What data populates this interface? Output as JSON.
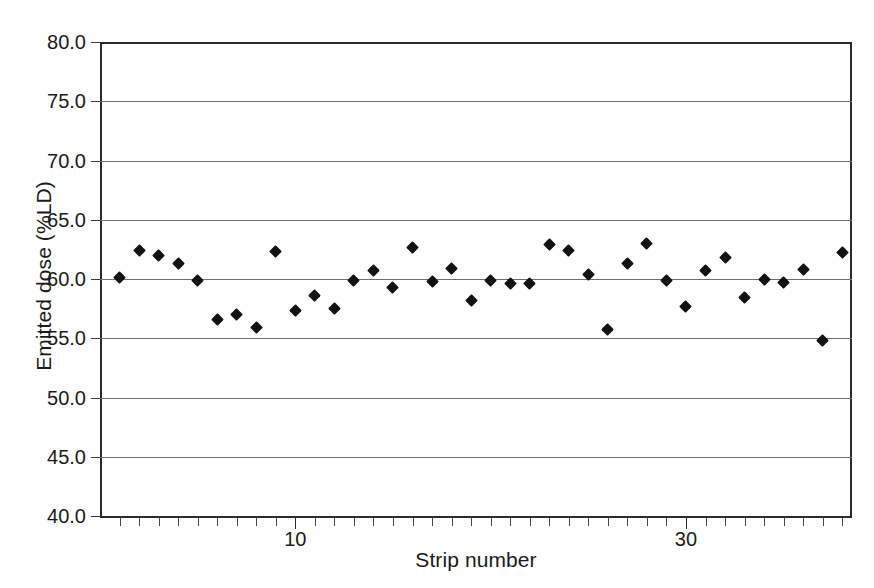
{
  "chart_data": {
    "type": "scatter",
    "title": "",
    "xlabel": "Strip number",
    "ylabel": "Emitted dose (%LD)",
    "xlim": [
      0,
      38.5
    ],
    "ylim": [
      40.0,
      80.0
    ],
    "grid": true,
    "legend": null,
    "marker": "black-diamond",
    "y_ticks": [
      40.0,
      45.0,
      50.0,
      55.0,
      60.0,
      65.0,
      70.0,
      75.0,
      80.0
    ],
    "y_tick_labels": [
      "40.0",
      "45.0",
      "50.0",
      "55.0",
      "60.0",
      "65.0",
      "70.0",
      "75.0",
      "80.0"
    ],
    "x_ticks": [
      10,
      30
    ],
    "x_tick_labels": [
      "10",
      "30"
    ],
    "x_minor_tick_step": 1,
    "series": [
      {
        "name": "Emitted dose",
        "color": "#121212",
        "x": [
          1,
          2,
          3,
          4,
          5,
          6,
          7,
          8,
          9,
          10,
          11,
          12,
          13,
          14,
          15,
          16,
          17,
          18,
          19,
          20,
          21,
          22,
          23,
          24,
          25,
          26,
          27,
          28,
          29,
          30,
          31,
          32,
          33,
          34,
          35,
          36,
          37,
          38
        ],
        "y": [
          60.1,
          62.4,
          62.0,
          61.3,
          59.9,
          56.6,
          57.0,
          55.9,
          62.3,
          57.3,
          58.6,
          57.5,
          59.9,
          60.7,
          59.3,
          62.7,
          59.8,
          60.9,
          58.2,
          59.9,
          59.6,
          59.6,
          62.9,
          62.4,
          60.4,
          55.7,
          61.3,
          63.0,
          59.9,
          57.7,
          60.7,
          61.8,
          58.4,
          60.0,
          59.7,
          60.8,
          54.8,
          62.2
        ]
      }
    ]
  },
  "axes": {
    "y_title": "Emitted dose (%LD)",
    "x_title": "Strip number"
  }
}
